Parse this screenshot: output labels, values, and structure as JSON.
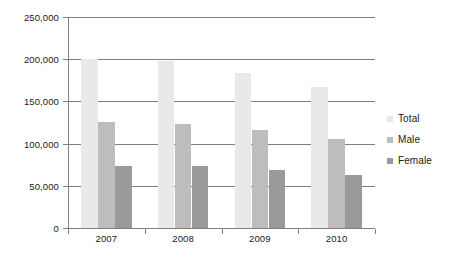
{
  "chart_data": {
    "type": "bar",
    "title": "",
    "subtitle": "",
    "xlabel": "",
    "ylabel": "",
    "categories": [
      "2007",
      "2008",
      "2009",
      "2010"
    ],
    "series": [
      {
        "name": "Total",
        "color": "#e9e9e9",
        "values": [
          200000,
          198000,
          184000,
          167000
        ]
      },
      {
        "name": "Male",
        "color": "#bdbdbd",
        "values": [
          126000,
          123000,
          116000,
          105000
        ]
      },
      {
        "name": "Female",
        "color": "#9a9a9a",
        "values": [
          74000,
          73000,
          69000,
          63000
        ]
      }
    ],
    "ylim": [
      0,
      250000
    ],
    "ytick_values": [
      250000,
      200000,
      150000,
      100000,
      50000,
      0
    ],
    "ytick_labels": [
      "250,000",
      "200,000",
      "150,000",
      "100,000",
      "50,000",
      "0"
    ],
    "grid": true,
    "grid_axis": "y",
    "grid_color": "#808080",
    "legend_position": "right",
    "background": "#ffffff",
    "axis_color": "#808080",
    "text_color": "#1a1a1a"
  }
}
